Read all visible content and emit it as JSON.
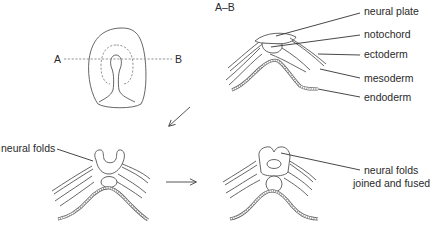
{
  "figure": {
    "section_label": "A–B",
    "section_line": {
      "start_label": "A",
      "end_label": "B"
    },
    "panels": [
      {
        "id": "dorsal-view",
        "description": "Dorsal view of embryo with section line A–B"
      },
      {
        "id": "cross-section-neural-plate",
        "heading": "A–B",
        "labels": [
          "neural plate",
          "notochord",
          "ectoderm",
          "mesoderm",
          "endoderm"
        ]
      },
      {
        "id": "cross-section-neural-folds",
        "labels": [
          "neural folds"
        ]
      },
      {
        "id": "cross-section-neural-tube",
        "labels": [
          "neural folds joined and fused"
        ]
      }
    ],
    "labels": {
      "a": "A",
      "b": "B",
      "section": "A–B",
      "neural_plate": "neural plate",
      "notochord": "notochord",
      "ectoderm": "ectoderm",
      "mesoderm": "mesoderm",
      "endoderm": "endoderm",
      "neural_folds": "neural folds",
      "fused_line1": "neural folds",
      "fused_line2": "joined and fused"
    },
    "arrows": [
      {
        "from": "cross-section-neural-plate",
        "to": "cross-section-neural-folds",
        "direction": "down-left"
      },
      {
        "from": "cross-section-neural-folds",
        "to": "cross-section-neural-tube",
        "direction": "right"
      }
    ],
    "colors": {
      "line": "#555555",
      "text": "#2a2a2a",
      "background": "#ffffff"
    }
  }
}
